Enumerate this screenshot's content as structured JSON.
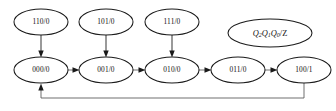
{
  "diagram": {
    "type": "finite-state-machine",
    "legend": {
      "text": "Q2Q1Q0/Z",
      "q2": "Q",
      "q2_sub": "2",
      "q1": "Q",
      "q1_sub": "1",
      "q0": "Q",
      "q0_sub": "0",
      "output": "/Z"
    },
    "colors": {
      "node_stroke": "#1a1a1a",
      "node_fill": "#ffffff",
      "edge": "#2b2b2b",
      "edge_light": "#555555",
      "text": "#111111",
      "background": "#ffffff"
    },
    "states": [
      {
        "id": "s110",
        "label": "110/0",
        "cx": 41,
        "cy": 22,
        "rx": 27,
        "ry": 13,
        "row": "top"
      },
      {
        "id": "s101",
        "label": "101/0",
        "cx": 106,
        "cy": 22,
        "rx": 27,
        "ry": 13,
        "row": "top"
      },
      {
        "id": "s111",
        "label": "111/0",
        "cx": 172,
        "cy": 22,
        "rx": 27,
        "ry": 13,
        "row": "top"
      },
      {
        "id": "s000",
        "label": "000/0",
        "cx": 41,
        "cy": 70,
        "rx": 27,
        "ry": 13,
        "row": "bottom"
      },
      {
        "id": "s001",
        "label": "001/0",
        "cx": 106,
        "cy": 70,
        "rx": 27,
        "ry": 13,
        "row": "bottom"
      },
      {
        "id": "s010",
        "label": "010/0",
        "cx": 172,
        "cy": 70,
        "rx": 27,
        "ry": 13,
        "row": "bottom"
      },
      {
        "id": "s011",
        "label": "011/0",
        "cx": 238,
        "cy": 70,
        "rx": 27,
        "ry": 13,
        "row": "bottom"
      },
      {
        "id": "s100",
        "label": "100/1",
        "cx": 304,
        "cy": 70,
        "rx": 27,
        "ry": 13,
        "row": "bottom"
      }
    ],
    "transitions": [
      {
        "from": "s110",
        "to": "s000",
        "kind": "vertical"
      },
      {
        "from": "s101",
        "to": "s001",
        "kind": "vertical"
      },
      {
        "from": "s111",
        "to": "s010",
        "kind": "vertical"
      },
      {
        "from": "s000",
        "to": "s001",
        "kind": "horizontal"
      },
      {
        "from": "s001",
        "to": "s010",
        "kind": "horizontal"
      },
      {
        "from": "s010",
        "to": "s011",
        "kind": "horizontal"
      },
      {
        "from": "s011",
        "to": "s100",
        "kind": "horizontal"
      },
      {
        "from": "s100",
        "to": "s000",
        "kind": "feedback-loop"
      }
    ]
  }
}
